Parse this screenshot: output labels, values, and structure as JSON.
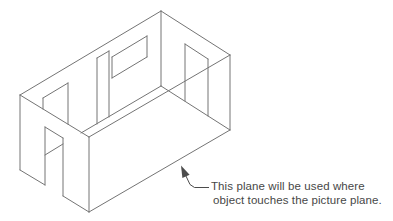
{
  "figure": {
    "canvas": {
      "width": 393,
      "height": 221,
      "background": "#ffffff"
    },
    "stroke_color": "#747474",
    "stroke_width": 1,
    "lines": [
      [
        20,
        95,
        161,
        11
      ],
      [
        161,
        11,
        230,
        55
      ],
      [
        20,
        95,
        89,
        137
      ],
      [
        89,
        137,
        230,
        55
      ],
      [
        20,
        95,
        20,
        170
      ],
      [
        161,
        11,
        161,
        86
      ],
      [
        230,
        55,
        230,
        130
      ],
      [
        89,
        137,
        89,
        212
      ],
      [
        20,
        170,
        45,
        185
      ],
      [
        63,
        196,
        89,
        212
      ],
      [
        89,
        212,
        230,
        130
      ],
      [
        161,
        86,
        81,
        133
      ],
      [
        63,
        144,
        45,
        155
      ],
      [
        161,
        86,
        230,
        130
      ],
      [
        43,
        98,
        68,
        83
      ],
      [
        43,
        98,
        43,
        109
      ],
      [
        68,
        83,
        68,
        124
      ],
      [
        97,
        58,
        109,
        51
      ],
      [
        97,
        58,
        97,
        124
      ],
      [
        109,
        51,
        109,
        117
      ],
      [
        112,
        57,
        147,
        36
      ],
      [
        112,
        78,
        147,
        57
      ],
      [
        112,
        57,
        112,
        78
      ],
      [
        147,
        36,
        147,
        57
      ],
      [
        185,
        44,
        208,
        59
      ],
      [
        185,
        44,
        185,
        101
      ],
      [
        208,
        59,
        208,
        116
      ],
      [
        45,
        127,
        63,
        138
      ],
      [
        45,
        127,
        45,
        185
      ],
      [
        63,
        138,
        63,
        196
      ]
    ]
  },
  "leader": {
    "color": "#4c4c4c",
    "polyline": [
      [
        185,
        174
      ],
      [
        190,
        184.5
      ],
      [
        194.5,
        187.5
      ],
      [
        209,
        187.5
      ]
    ],
    "arrowhead": [
      [
        181,
        165.5
      ],
      [
        182.4,
        178.1
      ],
      [
        189.6,
        174.7
      ]
    ]
  },
  "annotation": {
    "color": "#474747",
    "line1": "This plane will be used where",
    "line2": "object touches the picture plane."
  }
}
